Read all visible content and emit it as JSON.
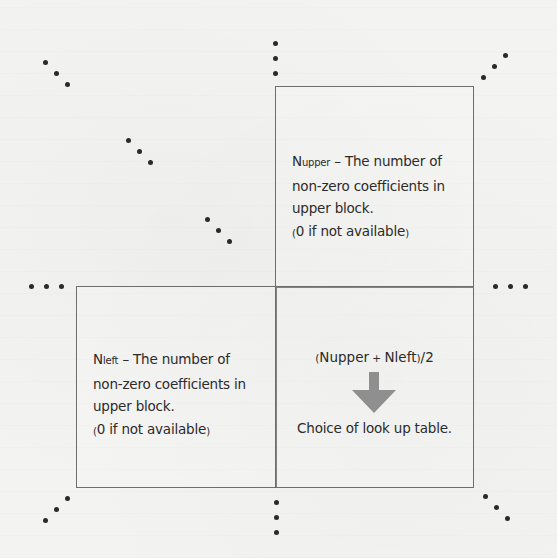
{
  "diagram": {
    "blocks": {
      "upper": {
        "symbol": "N",
        "subscript": "upper",
        "separator": "–",
        "line1_rest": "The number of",
        "line2": "non-zero coefficients in",
        "line3": "upper block.",
        "line4_open": "(",
        "line4_text": "0 if not available",
        "line4_close": ")"
      },
      "left": {
        "symbol": "N",
        "subscript": "left",
        "separator": "–",
        "line1_rest": "The number of",
        "line2": "non-zero coefficients in",
        "line3": "upper block.",
        "line4_open": "(",
        "line4_text": "0 if not available",
        "line4_close": ")"
      },
      "current": {
        "formula_open": "(",
        "formula_a": "Nupper",
        "formula_op": "+",
        "formula_b": "Nleft",
        "formula_close": ")",
        "formula_div": "/2",
        "arrow": "down-arrow-icon",
        "result": "Choice of look up table."
      }
    },
    "colors": {
      "border": "#6e6e6e",
      "text": "#2b2b2b",
      "arrow": "#8f8f8f",
      "dots": "#2a2a2a",
      "background": "#f3f3f1"
    },
    "ellipses": [
      {
        "name": "ellipsis-top-left-1",
        "points": [
          [
            45,
            62
          ],
          [
            56,
            73
          ],
          [
            67,
            84
          ]
        ]
      },
      {
        "name": "ellipsis-top-left-2",
        "points": [
          [
            128,
            140
          ],
          [
            139,
            151
          ],
          [
            150,
            162
          ]
        ]
      },
      {
        "name": "ellipsis-top-left-3",
        "points": [
          [
            207,
            219
          ],
          [
            218,
            230
          ],
          [
            229,
            241
          ]
        ]
      },
      {
        "name": "ellipsis-top-center",
        "points": [
          [
            275,
            43
          ],
          [
            275,
            58
          ],
          [
            275,
            73
          ]
        ]
      },
      {
        "name": "ellipsis-top-right",
        "points": [
          [
            483,
            77
          ],
          [
            494,
            66
          ],
          [
            505,
            55
          ]
        ]
      },
      {
        "name": "ellipsis-left",
        "points": [
          [
            31,
            286
          ],
          [
            46,
            286
          ],
          [
            61,
            286
          ]
        ]
      },
      {
        "name": "ellipsis-right",
        "points": [
          [
            495,
            286
          ],
          [
            510,
            286
          ],
          [
            525,
            286
          ]
        ]
      },
      {
        "name": "ellipsis-bottom-left",
        "points": [
          [
            67,
            498
          ],
          [
            56,
            509
          ],
          [
            45,
            520
          ]
        ]
      },
      {
        "name": "ellipsis-bottom-center",
        "points": [
          [
            276,
            502
          ],
          [
            276,
            517
          ],
          [
            276,
            532
          ]
        ]
      },
      {
        "name": "ellipsis-bottom-right",
        "points": [
          [
            485,
            496
          ],
          [
            496,
            507
          ],
          [
            507,
            518
          ]
        ]
      }
    ]
  }
}
